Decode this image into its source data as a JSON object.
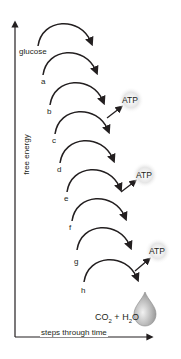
{
  "diagram": {
    "axes": {
      "y_label": "free energy",
      "x_label": "steps through time"
    },
    "steps": [
      {
        "id": "glucose",
        "label": "glucose"
      },
      {
        "id": "a",
        "label": "a"
      },
      {
        "id": "b",
        "label": "b"
      },
      {
        "id": "c",
        "label": "c"
      },
      {
        "id": "d",
        "label": "d"
      },
      {
        "id": "e",
        "label": "e"
      },
      {
        "id": "f",
        "label": "f"
      },
      {
        "id": "g",
        "label": "g"
      },
      {
        "id": "h",
        "label": "h"
      }
    ],
    "atp_outputs": [
      {
        "after_step": "b",
        "label": "ATP"
      },
      {
        "after_step": "e",
        "label": "ATP"
      },
      {
        "after_step": "g",
        "label": "ATP"
      }
    ],
    "products": {
      "co2": "CO",
      "co2_sub": "2",
      "plus": "+",
      "h2o_h": "H",
      "h2o_sub": "2",
      "h2o_o": "O"
    },
    "colors": {
      "line": "#231f20",
      "drop": "#bfbfbf",
      "burst": "#d0d0d0"
    }
  }
}
